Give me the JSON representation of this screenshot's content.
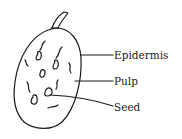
{
  "diagram": {
    "labels": [
      {
        "id": "epidermis",
        "text": "Epidermis"
      },
      {
        "id": "pulp",
        "text": "Pulp"
      },
      {
        "id": "seed",
        "text": "Seed"
      }
    ],
    "stroke_color": "#1a1a1a",
    "background": "#ffffff"
  }
}
